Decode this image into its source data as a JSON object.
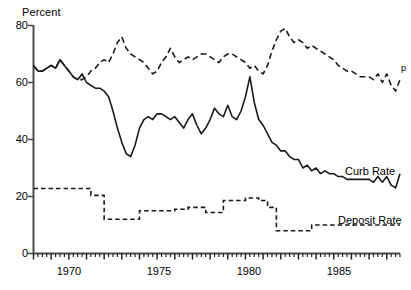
{
  "chart_data": {
    "type": "line",
    "title": "",
    "subtitle": "",
    "ylabel": "Percent",
    "xlabel": "",
    "ylim": [
      0,
      80
    ],
    "yticks": [
      0,
      20,
      40,
      60,
      80
    ],
    "ytick_labels": [
      "0",
      "20",
      "40",
      "60",
      "80"
    ],
    "xlim": [
      1968.0,
      1988.75
    ],
    "xticks": [
      1970,
      1975,
      1980,
      1985
    ],
    "xtick_labels": [
      "1970",
      "1975",
      "1980",
      "1985"
    ],
    "minor_tick_interval_years": 0.25,
    "grid": false,
    "legend_position": "inline-right",
    "annotations": [
      {
        "text": "p",
        "x": 1988.75,
        "y": 61,
        "meaning": "preliminary"
      }
    ],
    "series": [
      {
        "name": "Upper Dashed Series",
        "label": "",
        "style": "dashed",
        "color": "#000000",
        "x": [
          1968.0,
          1968.25,
          1968.5,
          1968.75,
          1969.0,
          1969.25,
          1969.5,
          1969.75,
          1970.0,
          1970.25,
          1970.5,
          1970.75,
          1971.0,
          1971.25,
          1971.5,
          1971.75,
          1972.0,
          1972.25,
          1972.5,
          1972.75,
          1973.0,
          1973.25,
          1973.5,
          1973.75,
          1974.0,
          1974.25,
          1974.5,
          1974.75,
          1975.0,
          1975.25,
          1975.5,
          1975.75,
          1976.0,
          1976.25,
          1976.5,
          1976.75,
          1977.0,
          1977.25,
          1977.5,
          1977.75,
          1978.0,
          1978.25,
          1978.5,
          1978.75,
          1979.0,
          1979.25,
          1979.5,
          1979.75,
          1980.0,
          1980.25,
          1980.5,
          1980.75,
          1981.0,
          1981.25,
          1981.5,
          1981.75,
          1982.0,
          1982.25,
          1982.5,
          1982.75,
          1983.0,
          1983.25,
          1983.5,
          1983.75,
          1984.0,
          1984.25,
          1984.5,
          1984.75,
          1985.0,
          1985.25,
          1985.5,
          1985.75,
          1986.0,
          1986.25,
          1986.5,
          1986.75,
          1987.0,
          1987.25,
          1987.5,
          1987.75,
          1988.0,
          1988.25,
          1988.5,
          1988.75
        ],
        "values": [
          66,
          64,
          64,
          65,
          66,
          65,
          68,
          66,
          64,
          62,
          61,
          61,
          62,
          64,
          65,
          67,
          68,
          67,
          70,
          74,
          76,
          72,
          70,
          69,
          68,
          67,
          65,
          63,
          64,
          67,
          69,
          72,
          69,
          67,
          68,
          69,
          68,
          69,
          70,
          70,
          69,
          68,
          67,
          69,
          70,
          70,
          69,
          68,
          67,
          65,
          66,
          64,
          63,
          66,
          71,
          75,
          78,
          79,
          76,
          74,
          75,
          74,
          72,
          73,
          72,
          71,
          70,
          69,
          68,
          66,
          65,
          64,
          64,
          63,
          62,
          62,
          62,
          61,
          63,
          60,
          63,
          59,
          57,
          61
        ]
      },
      {
        "name": "Curb Rate",
        "label": "Curb Rate",
        "style": "solid",
        "color": "#000000",
        "x": [
          1968.0,
          1968.25,
          1968.5,
          1968.75,
          1969.0,
          1969.25,
          1969.5,
          1969.75,
          1970.0,
          1970.25,
          1970.5,
          1970.75,
          1971.0,
          1971.25,
          1971.5,
          1971.75,
          1972.0,
          1972.25,
          1972.5,
          1972.75,
          1973.0,
          1973.25,
          1973.5,
          1973.75,
          1974.0,
          1974.25,
          1974.5,
          1974.75,
          1975.0,
          1975.25,
          1975.5,
          1975.75,
          1976.0,
          1976.25,
          1976.5,
          1976.75,
          1977.0,
          1977.25,
          1977.5,
          1977.75,
          1978.0,
          1978.25,
          1978.5,
          1978.75,
          1979.0,
          1979.25,
          1979.5,
          1979.75,
          1980.0,
          1980.25,
          1980.5,
          1980.75,
          1981.0,
          1981.25,
          1981.5,
          1981.75,
          1982.0,
          1982.25,
          1982.5,
          1982.75,
          1983.0,
          1983.25,
          1983.5,
          1983.75,
          1984.0,
          1984.25,
          1984.5,
          1984.75,
          1985.0,
          1985.25,
          1985.5,
          1985.75,
          1986.0,
          1986.25,
          1986.5,
          1986.75,
          1987.0,
          1987.25,
          1987.5,
          1987.75,
          1988.0,
          1988.25,
          1988.5,
          1988.75
        ],
        "values": [
          66,
          64,
          64,
          65,
          66,
          65,
          68,
          66,
          64,
          62,
          61,
          63,
          60,
          59,
          58,
          58,
          57,
          55,
          50,
          44,
          39,
          35,
          34,
          38,
          44,
          47,
          48,
          47,
          49,
          49,
          48,
          47,
          48,
          46,
          44,
          47,
          49,
          45,
          42,
          44,
          47,
          51,
          49,
          48,
          52,
          48,
          47,
          50,
          55,
          62,
          53,
          47,
          45,
          42,
          39,
          38,
          36,
          36,
          34,
          33,
          33,
          30,
          31,
          29,
          30,
          28,
          29,
          28,
          28,
          27,
          27,
          26,
          26,
          26,
          26,
          26,
          26,
          25,
          27,
          25,
          27,
          24,
          23,
          28
        ]
      },
      {
        "name": "Deposit Rate",
        "label": "Deposit Rate",
        "style": "dashed-step",
        "color": "#000000",
        "x": [
          1968.0,
          1968.25,
          1968.5,
          1968.75,
          1969.0,
          1969.25,
          1969.5,
          1969.75,
          1970.0,
          1970.25,
          1970.5,
          1970.75,
          1971.0,
          1971.25,
          1971.5,
          1971.75,
          1972.0,
          1972.25,
          1972.5,
          1972.75,
          1973.0,
          1973.25,
          1973.5,
          1973.75,
          1974.0,
          1974.25,
          1974.5,
          1974.75,
          1975.0,
          1975.25,
          1975.5,
          1975.75,
          1976.0,
          1976.25,
          1976.5,
          1976.75,
          1977.0,
          1977.25,
          1977.5,
          1977.75,
          1978.0,
          1978.25,
          1978.5,
          1978.75,
          1979.0,
          1979.25,
          1979.5,
          1979.75,
          1980.0,
          1980.25,
          1980.5,
          1980.75,
          1981.0,
          1981.25,
          1981.5,
          1981.75,
          1982.0,
          1982.25,
          1982.5,
          1982.75,
          1983.0,
          1983.25,
          1983.5,
          1983.75,
          1984.0,
          1984.25,
          1984.5,
          1984.75,
          1985.0,
          1985.25,
          1985.5,
          1985.75,
          1986.0,
          1986.25,
          1986.5,
          1986.75,
          1987.0,
          1987.25,
          1987.5,
          1987.75,
          1988.0,
          1988.25,
          1988.5,
          1988.75
        ],
        "values": [
          22.8,
          22.8,
          22.8,
          22.8,
          22.8,
          22.8,
          22.8,
          22.8,
          22.8,
          22.8,
          22.8,
          22.8,
          22.8,
          20.4,
          20.4,
          20.4,
          12.0,
          12.0,
          12.0,
          12.0,
          12.0,
          12.0,
          12.0,
          12.0,
          15.0,
          15.0,
          15.0,
          15.0,
          15.0,
          15.0,
          15.0,
          15.0,
          15.5,
          15.5,
          15.5,
          16.2,
          16.2,
          16.2,
          16.2,
          14.4,
          14.4,
          14.4,
          14.4,
          18.6,
          18.6,
          18.6,
          18.6,
          18.6,
          19.5,
          19.5,
          19.5,
          18.6,
          18.6,
          16.2,
          16.2,
          8.0,
          8.0,
          8.0,
          8.0,
          8.0,
          8.0,
          8.0,
          8.0,
          10.0,
          10.0,
          10.0,
          10.0,
          10.0,
          10.0,
          10.0,
          10.0,
          10.0,
          10.0,
          10.0,
          10.0,
          10.0,
          10.0,
          10.0,
          10.0,
          10.0,
          10.0,
          10.0,
          10.0,
          10.0
        ]
      }
    ]
  },
  "labels": {
    "ylabel": "Percent",
    "curb_rate": "Curb Rate",
    "deposit_rate": "Deposit Rate",
    "preliminary_flag": "p",
    "y0": "0",
    "y20": "20",
    "y40": "40",
    "y60": "60",
    "y80": "80",
    "x1970": "1970",
    "x1975": "1975",
    "x1980": "1980",
    "x1985": "1985"
  },
  "style": {
    "line_color": "#1a1a1a",
    "axis_color": "#4d4d4d",
    "background": "#ffffff"
  }
}
